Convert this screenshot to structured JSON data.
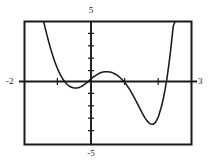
{
  "graph": {
    "title": "",
    "labels": {
      "x_min": "-2",
      "x_max": "3",
      "y_max": "5",
      "y_min": "-5"
    },
    "frame_color": "#1a1a1a",
    "curve_color": "#1a1a1a",
    "axis_color": "#1a1a1a",
    "background_color": "#ffffff"
  },
  "chart_data": {
    "type": "line",
    "title": "",
    "xlabel": "",
    "ylabel": "",
    "xlim": [
      -2,
      3
    ],
    "ylim": [
      -5,
      5
    ],
    "grid": false,
    "legend": "none",
    "tick_labels": {
      "x": [
        "-2",
        "3"
      ],
      "y": [
        "-5",
        "5"
      ]
    },
    "x_tick_interval": 1,
    "y_tick_interval": 1,
    "axes_drawn": [
      "x-axis at y=0",
      "y-axis at x=0"
    ],
    "annotations": [
      "local minimum near (-0.35, -0.4)",
      "local maximum near (0.5, 0.9)",
      "local minimum near (1.65, -3.3)"
    ],
    "series": [
      {
        "name": "curve",
        "x": [
          -1.42,
          -1.38,
          -1.32,
          -1.26,
          -1.2,
          -1.14,
          -1.08,
          -1.02,
          -0.96,
          -0.9,
          -0.84,
          -0.78,
          -0.72,
          -0.66,
          -0.6,
          -0.54,
          -0.48,
          -0.42,
          -0.36,
          -0.3,
          -0.24,
          -0.18,
          -0.12,
          -0.06,
          0.0,
          0.08,
          0.16,
          0.24,
          0.32,
          0.4,
          0.48,
          0.56,
          0.64,
          0.72,
          0.8,
          0.88,
          0.96,
          1.04,
          1.12,
          1.2,
          1.28,
          1.36,
          1.44,
          1.52,
          1.6,
          1.68,
          1.76,
          1.84,
          1.92,
          2.0,
          2.08,
          2.14,
          2.2,
          2.26,
          2.32,
          2.38,
          2.44,
          2.5
        ],
        "y": [
          5.0,
          4.55,
          3.9,
          3.28,
          2.7,
          2.18,
          1.7,
          1.27,
          0.9,
          0.57,
          0.3,
          0.08,
          -0.1,
          -0.24,
          -0.33,
          -0.39,
          -0.41,
          -0.4,
          -0.36,
          -0.29,
          -0.2,
          -0.08,
          0.05,
          0.2,
          0.35,
          0.52,
          0.66,
          0.78,
          0.86,
          0.9,
          0.91,
          0.88,
          0.82,
          0.71,
          0.57,
          0.38,
          0.16,
          -0.11,
          -0.42,
          -0.78,
          -1.17,
          -1.59,
          -2.01,
          -2.43,
          -2.81,
          -3.12,
          -3.31,
          -3.33,
          -3.15,
          -2.72,
          -2.0,
          -1.35,
          -0.52,
          0.48,
          1.66,
          3.02,
          4.55,
          5.0
        ]
      }
    ]
  }
}
